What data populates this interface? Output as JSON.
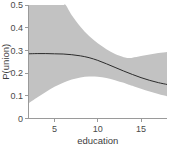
{
  "chart_data": {
    "type": "line",
    "title": "",
    "subtitle": "",
    "xlabel": "education",
    "ylabel": "P(union)",
    "xlim": [
      2.0,
      18.0
    ],
    "ylim": [
      0.0,
      0.5
    ],
    "xticks": [
      5,
      10,
      15
    ],
    "xtick_labels": [
      "5",
      "10",
      "15"
    ],
    "yticks": [
      0,
      0.1,
      0.2,
      0.3,
      0.4,
      0.5
    ],
    "ytick_labels": [
      "0",
      "0.1",
      "0.2",
      "0.3",
      "0.4",
      "0.5"
    ],
    "grid": false,
    "legend": "none",
    "annotations": [],
    "colors": {
      "band_fill": "#c2c2c2",
      "fit_line": "#2b2b2b",
      "axis": "#9a9a9a",
      "text": "#4a4a4a",
      "background": "#ffffff"
    },
    "series": [
      {
        "name": "P(union) fit",
        "style": "line",
        "x": [
          2.0,
          3.0,
          4.0,
          5.0,
          6.0,
          7.0,
          8.0,
          9.0,
          10.0,
          11.0,
          12.0,
          13.0,
          14.0,
          15.0,
          16.0,
          17.0,
          18.0
        ],
        "values": [
          0.285,
          0.286,
          0.286,
          0.285,
          0.284,
          0.281,
          0.276,
          0.268,
          0.256,
          0.241,
          0.225,
          0.209,
          0.194,
          0.18,
          0.168,
          0.158,
          0.15
        ]
      },
      {
        "name": "upper 95% confidence bound",
        "style": "band-upper",
        "x": [
          2.0,
          3.0,
          4.0,
          5.0,
          6.0,
          6.3,
          7.0,
          8.0,
          9.0,
          10.0,
          11.0,
          12.0,
          13.0,
          13.5,
          14.0,
          15.0,
          16.0,
          17.0,
          18.0
        ],
        "values": [
          0.5,
          0.5,
          0.5,
          0.5,
          0.5,
          0.5,
          0.455,
          0.404,
          0.363,
          0.331,
          0.305,
          0.284,
          0.27,
          0.267,
          0.268,
          0.275,
          0.282,
          0.288,
          0.293
        ]
      },
      {
        "name": "lower 95% confidence bound",
        "style": "band-lower",
        "x": [
          2.0,
          3.0,
          4.0,
          5.0,
          6.0,
          7.0,
          8.0,
          9.0,
          10.0,
          11.0,
          12.0,
          13.0,
          13.5,
          14.0,
          15.0,
          16.0,
          17.0,
          18.0
        ],
        "values": [
          0.066,
          0.092,
          0.117,
          0.14,
          0.158,
          0.172,
          0.181,
          0.185,
          0.184,
          0.178,
          0.169,
          0.157,
          0.15,
          0.144,
          0.131,
          0.119,
          0.108,
          0.098
        ]
      }
    ]
  }
}
